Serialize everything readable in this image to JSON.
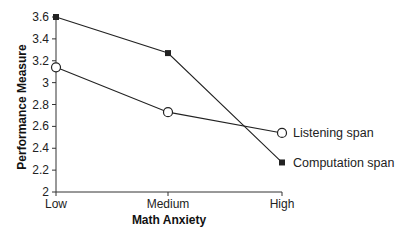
{
  "chart_data": {
    "type": "line",
    "title": "",
    "xlabel": "Math Anxiety",
    "ylabel": "Performance Measure",
    "categories": [
      "Low",
      "Medium",
      "High"
    ],
    "ylim": [
      2,
      3.6
    ],
    "yticks": [
      2,
      2.2,
      2.4,
      2.6,
      2.8,
      3,
      3.2,
      3.4,
      3.6
    ],
    "ytick_labels": [
      "2",
      "2.2",
      "2.4",
      "2.6",
      "2.8",
      "3",
      "3.2",
      "3.4",
      "3.6"
    ],
    "grid": false,
    "legend_position": "inline-right",
    "series": [
      {
        "name": "Listening span",
        "marker": "open-circle",
        "values": [
          3.14,
          2.73,
          2.54
        ]
      },
      {
        "name": "Computation span",
        "marker": "filled-square",
        "values": [
          3.6,
          3.27,
          2.27
        ]
      }
    ]
  },
  "colors": {
    "line": "#222222",
    "axis": "#333333",
    "background": "#ffffff"
  }
}
